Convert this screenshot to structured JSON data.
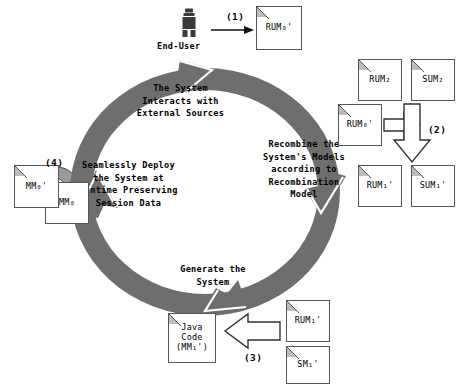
{
  "diagram": {
    "colors": {
      "ring": "#6e6e6e",
      "ring_outline": "#5a5a5a",
      "doc_border": "#555555",
      "doc_fill": "#ffffff",
      "fold": "#bdbdbd",
      "arrow_outline": "#333333",
      "text": "#000000",
      "enduser": "#3a3a3a"
    },
    "ring": {
      "direction": "clockwise",
      "labels": [
        {
          "id": "top",
          "text": "The System\nInteracts with\nExternal Sources"
        },
        {
          "id": "right",
          "text": "Recombine the\nSystem's Models\naccording to\nRecombination\nModel"
        },
        {
          "id": "bottom",
          "text": "Generate the\nSystem"
        },
        {
          "id": "left",
          "text": "Seamlessly Deploy\nthe System at\nRuntime Preserving\nSession Data"
        }
      ]
    },
    "steps": {
      "one": "(1)",
      "two": "(2)",
      "three": "(3)",
      "four": "(4)"
    },
    "actors": {
      "enduser_icon": "person-icon",
      "enduser_label": "End-User"
    },
    "documents": [
      {
        "id": "rum0_top",
        "label": "RUM",
        "sub": "0",
        "prime": "'"
      },
      {
        "id": "rum2",
        "label": "RUM",
        "sub": "2",
        "prime": ""
      },
      {
        "id": "sum2",
        "label": "SUM",
        "sub": "2",
        "prime": ""
      },
      {
        "id": "rum0_mid",
        "label": "RUM",
        "sub": "0",
        "prime": "'"
      },
      {
        "id": "rum1p",
        "label": "RUM",
        "sub": "1",
        "prime": "'"
      },
      {
        "id": "sum1p",
        "label": "SUM",
        "sub": "1",
        "prime": "'"
      },
      {
        "id": "rum1p_bot",
        "label": "RUM",
        "sub": "1",
        "prime": "'"
      },
      {
        "id": "sm1p",
        "label": "SM",
        "sub": "1",
        "prime": "'"
      },
      {
        "id": "javacode",
        "label": "Java\nCode\n(MM",
        "sub": "1",
        "prime": "')"
      },
      {
        "id": "mm0p",
        "label": "MM",
        "sub": "0",
        "prime": "'"
      },
      {
        "id": "mm0",
        "label": "MM",
        "sub": "0",
        "prime": ""
      }
    ],
    "document_text": {
      "rum0_top": "RUM₀'",
      "rum2": "RUM₂",
      "sum2": "SUM₂",
      "rum0_mid": "RUM₀'",
      "rum1p": "RUM₁'",
      "sum1p": "SUM₁'",
      "rum1p_bot": "RUM₁'",
      "sm1p": "SM₁'",
      "javacode_line1": "Java",
      "javacode_line2": "Code",
      "javacode_line3": "(MM₁')",
      "mm0p": "MM₀'",
      "mm0": "MM₀"
    }
  }
}
